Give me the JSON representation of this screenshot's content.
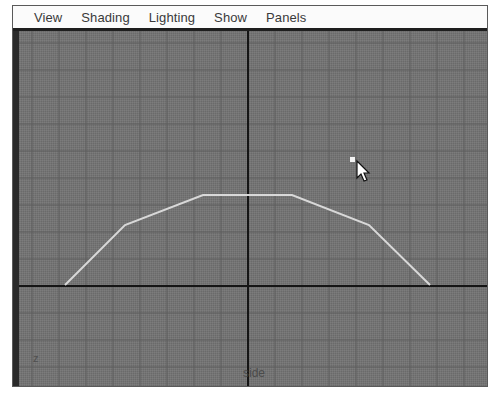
{
  "menu": {
    "items": [
      "View",
      "Shading",
      "Lighting",
      "Show",
      "Panels"
    ]
  },
  "viewport": {
    "camera_label": "side",
    "axis_indicator": "z",
    "background": "#727272",
    "grid_color": "#5f5f5f",
    "axis_color": "#151515",
    "curve_color": "#d8d8d8",
    "grid_spacing": 27,
    "origin": {
      "x": 229,
      "y": 255
    },
    "curve_points": [
      [
        46,
        254
      ],
      [
        106,
        194
      ],
      [
        184,
        164
      ],
      [
        273,
        164
      ],
      [
        350,
        194
      ],
      [
        411,
        254
      ]
    ],
    "selected_point": {
      "x": 333,
      "y": 128
    },
    "cursor": {
      "x": 338,
      "y": 130
    }
  }
}
